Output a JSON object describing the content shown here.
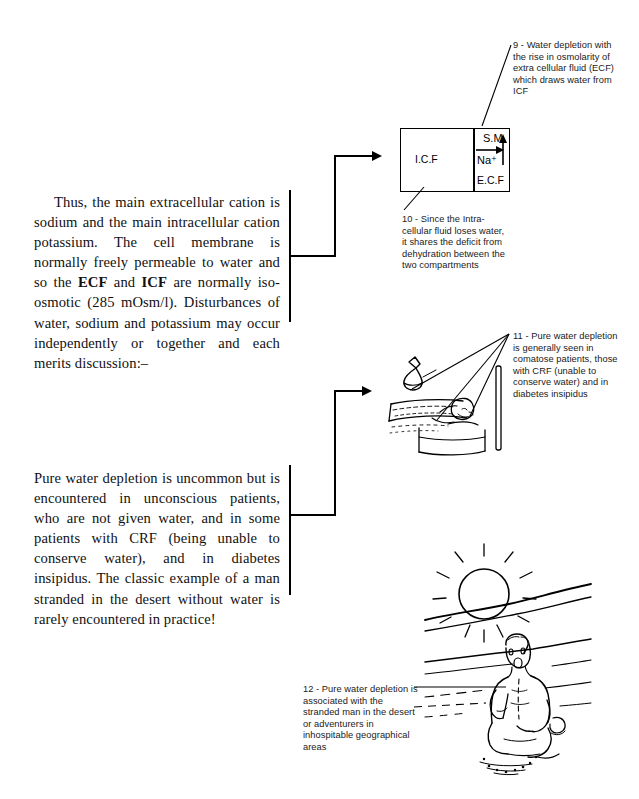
{
  "page": {
    "background": "#ffffff",
    "ink": "#000000",
    "width": 639,
    "height": 799
  },
  "body_text": {
    "paragraph_1_parts": [
      {
        "text": "Thus, the main extracellular cation is sodium and the main intracellular cation potassium. The cell membrane is normally freely permeable to water and so the ",
        "bold": false
      },
      {
        "text": "ECF",
        "bold": true
      },
      {
        "text": " and ",
        "bold": false
      },
      {
        "text": "ICF",
        "bold": true
      },
      {
        "text": " are normally iso-osmotic (285 mOsm/l). Disturbances of water, sodium and potassium may occur independently or together and each merits discussion:–",
        "bold": false
      }
    ],
    "paragraph_1_plain": "Thus, the main extracellular cation is sodium and the main intracellular cation potassium. The cell membrane is normally freely permeable to water and so the ECF and ICF are normally iso-osmotic (285 mOsm/l). Disturbances of water, sodium and potassium may occur independently or together and each merits discussion:–",
    "paragraph_2": "Pure water depletion is uncommon but is encountered in unconscious patients, who are not given water, and in some patients with CRF (being unable to conserve water), and in diabetes insipidus. The classic example of a man stranded in the desert without water is rarely encountered in practice!"
  },
  "captions": {
    "c9": {
      "number": "9",
      "text": "9 - Water depletion with the rise in osmolarity of extra cellular fluid (ECF) which draws water from ICF"
    },
    "c10": {
      "number": "10",
      "text": "10 - Since the Intra-cellular fluid loses water, it shares the deficit from dehydration between the two compartments"
    },
    "c11": {
      "number": "11",
      "text": "11 - Pure water depletion is generally seen in comatose patients, those with CRF (unable to conserve water) and in diabetes insipidus"
    },
    "c12": {
      "number": "12",
      "text": "12 - Pure water depletion is associated with the stranded man in the desert or adventurers in inhospitable geographical areas"
    }
  },
  "diagram_icf": {
    "name": "cell-compartment-diagram",
    "icf_label": "I.C.F",
    "sm_label": "S.M.",
    "na_label": "Na⁺",
    "ecf_label": "E.C.F",
    "arrow_right": "water moves from ICF to ECF",
    "arrow_up": "rising osmolarity"
  },
  "figures": {
    "bed_scene": {
      "name": "unconscious-patient-in-bed-illustration",
      "description": "Line drawing of a comatose patient lying in bed with a hanging fluid bag and drip stand"
    },
    "desert_scene": {
      "name": "stranded-man-in-desert-illustration",
      "description": "Line drawing of a man kneeling in the desert under a blazing sun with dunes behind"
    }
  },
  "connectors": {
    "bracket_1": "arrow from first paragraph to cell compartment diagram",
    "bracket_2": "arrow from second paragraph to bed scene illustration"
  }
}
